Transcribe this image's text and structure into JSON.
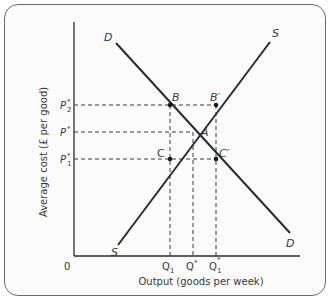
{
  "diagram": {
    "y_axis_label": "Average cost (£ per good)",
    "x_axis_label": "Output (goods per week)",
    "origin_label": "0",
    "curves": [
      {
        "name": "D",
        "start_label": "D",
        "end_label": "D"
      },
      {
        "name": "S",
        "start_label": "S",
        "end_label": "S"
      }
    ],
    "price_labels": {
      "p2": {
        "base": "P",
        "sub": "2",
        "sup": "*"
      },
      "p": {
        "base": "P",
        "sub": "",
        "sup": "*"
      },
      "p1": {
        "base": "P",
        "sub": "1",
        "sup": "*"
      }
    },
    "quantity_labels": {
      "q1": {
        "base": "Q",
        "sub": "1",
        "sup": ""
      },
      "q": {
        "base": "Q",
        "sub": "",
        "sup": "*"
      },
      "q1s": {
        "base": "Q",
        "sub": "1",
        "sup": "*"
      }
    },
    "points": {
      "A": "A",
      "B": "B",
      "B_prime": "B′",
      "C": "C",
      "C_prime": "C′"
    },
    "colors": {
      "line": "#2b2b2b",
      "dashed": "#3a3a3a",
      "frame": "#6b6b6b",
      "text": "#3a3a3a"
    }
  }
}
